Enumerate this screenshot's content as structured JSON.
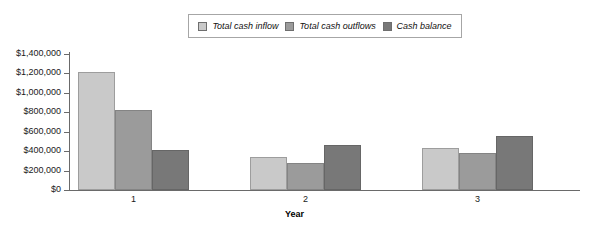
{
  "chart_data": {
    "type": "bar",
    "title": "",
    "xlabel": "Year",
    "ylabel": "",
    "categories": [
      "1",
      "2",
      "3"
    ],
    "series": [
      {
        "name": "Total cash inflow",
        "color": "#c9c9c9",
        "values": [
          1215000,
          340000,
          435000
        ]
      },
      {
        "name": "Total cash outflows",
        "color": "#9b9b9b",
        "values": [
          820000,
          280000,
          380000
        ]
      },
      {
        "name": "Cash balance",
        "color": "#787878",
        "values": [
          410000,
          465000,
          555000
        ]
      }
    ],
    "ylim": [
      0,
      1400000
    ],
    "ytick_values": [
      1400000,
      1200000,
      1000000,
      800000,
      600000,
      400000,
      200000,
      0
    ],
    "ytick_labels": [
      "$1,400,000",
      "$1,200,000",
      "$1,000,000",
      "$800,000",
      "$600,000",
      "$400,000",
      "$200,000",
      "$0"
    ],
    "grid": false,
    "legend_position": "top-center"
  },
  "legend": {
    "items": [
      {
        "label": "Total cash inflow",
        "swatch": "#c9c9c9"
      },
      {
        "label": "Total cash outflows",
        "swatch": "#9b9b9b"
      },
      {
        "label": "Cash balance",
        "swatch": "#787878"
      }
    ]
  },
  "axis": {
    "x_title": "Year"
  }
}
